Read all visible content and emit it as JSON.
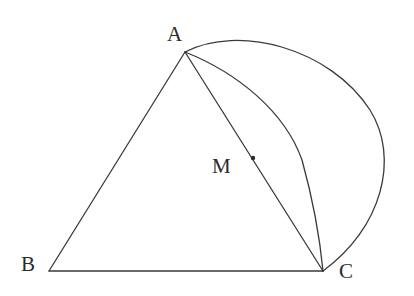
{
  "figure": {
    "background_color": "#ffffff",
    "stroke_color": "#3a3a3a",
    "label_color": "#2b2b2b",
    "stroke_width": 1.3,
    "width": 414,
    "height": 296
  },
  "labels": {
    "a": "A",
    "b": "B",
    "c": "C",
    "m": "M"
  },
  "points": {
    "A": {
      "name": "A",
      "x": 185,
      "y": 52
    },
    "B": {
      "name": "B",
      "x": 49,
      "y": 271
    },
    "C": {
      "name": "C",
      "x": 323,
      "y": 271
    },
    "M_dot": {
      "name": "M",
      "x": 253,
      "y": 158,
      "radius": 2.2
    }
  },
  "segments": [
    {
      "name": "side-AB",
      "from": "A",
      "to": "B",
      "x1": 185,
      "y1": 52,
      "x2": 49,
      "y2": 271
    },
    {
      "name": "side-BC",
      "from": "B",
      "to": "C",
      "x1": 49,
      "y1": 271,
      "x2": 323,
      "y2": 271
    },
    {
      "name": "cevian-AC",
      "from": "A",
      "to": "C",
      "x1": 185,
      "y1": 52,
      "x2": 323,
      "y2": 271
    }
  ],
  "arcs": [
    {
      "name": "outer-circle-arc-AC",
      "description": "Large circular arc from A clockwise over the top and right side down to C",
      "from": "A",
      "to": "C",
      "bulge": "right",
      "path": "M 185 52 C 238 24 330 48 370 110 C 400 158 382 228 323 271",
      "top_point": {
        "x": 265,
        "y": 30
      },
      "right_point": {
        "x": 382,
        "y": 160
      }
    },
    {
      "name": "inner-arc-AC",
      "description": "Smaller arc from A to C bulging to the right of segment AC",
      "from": "A",
      "to": "C",
      "bulge": "right",
      "path": "M 185 52 C 238 73 285 112 302 160 C 312 196 320 240 323 271",
      "mid_point": {
        "x": 297,
        "y": 160
      }
    }
  ]
}
